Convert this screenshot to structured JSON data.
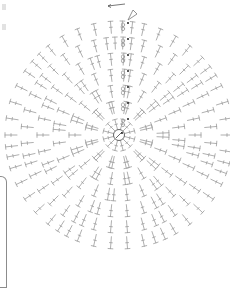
{
  "diagram": {
    "type": "crochet-circle-chart",
    "center": {
      "x": 119,
      "y": 135
    },
    "center_symbol": "magic-ring",
    "direction_arrow": "counterclockwise",
    "round_start_marker": "ch-3 (drawn as chain ovals '8')",
    "colors": {
      "stitch": "#9a9a9a",
      "ring": "#555555",
      "marker": "#222222",
      "background": "#ffffff"
    },
    "rounds": [
      {
        "round": 1,
        "radius": 14,
        "stitches": 12,
        "pattern": "dc"
      },
      {
        "round": 2,
        "radius": 30,
        "stitches": 12,
        "pattern": "V"
      },
      {
        "round": 3,
        "radius": 46,
        "stitches": 18,
        "pattern": "V,T"
      },
      {
        "round": 4,
        "radius": 62,
        "stitches": 24,
        "pattern": "V,T,T"
      },
      {
        "round": 5,
        "radius": 78,
        "stitches": 30,
        "pattern": "V,T,T,T"
      },
      {
        "round": 6,
        "radius": 94,
        "stitches": 36,
        "pattern": "V,T,T,T,T"
      },
      {
        "round": 7,
        "radius": 110,
        "stitches": 42,
        "pattern": "V,T,T,T,T,T"
      }
    ]
  }
}
